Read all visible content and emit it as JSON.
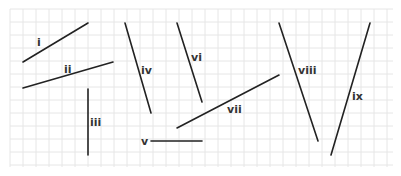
{
  "diagram": {
    "background": "#ffffff",
    "grid": {
      "x0": 10,
      "y0": 9,
      "x1": 393,
      "y1": 167,
      "cell": 13,
      "color": "#e6e6e6"
    },
    "line_color": "#222222",
    "segments": [
      {
        "label": "i",
        "x1": 23,
        "y1": 62,
        "x2": 88,
        "y2": 23,
        "lx": 37,
        "ly": 46
      },
      {
        "label": "ii",
        "x1": 23,
        "y1": 88,
        "x2": 113,
        "y2": 62,
        "lx": 64,
        "ly": 73
      },
      {
        "label": "iii",
        "x1": 88,
        "y1": 89,
        "x2": 88,
        "y2": 155,
        "lx": 90,
        "ly": 126
      },
      {
        "label": "iv",
        "x1": 125,
        "y1": 23,
        "x2": 151,
        "y2": 113,
        "lx": 141,
        "ly": 74
      },
      {
        "label": "v",
        "x1": 151,
        "y1": 141,
        "x2": 202,
        "y2": 141,
        "lx": 141,
        "ly": 145
      },
      {
        "label": "vi",
        "x1": 177,
        "y1": 23,
        "x2": 202,
        "y2": 102,
        "lx": 191,
        "ly": 61
      },
      {
        "label": "vii",
        "x1": 177,
        "y1": 128,
        "x2": 279,
        "y2": 75,
        "lx": 227,
        "ly": 113
      },
      {
        "label": "viii",
        "x1": 279,
        "y1": 23,
        "x2": 318,
        "y2": 141,
        "lx": 298,
        "ly": 74
      },
      {
        "label": "ix",
        "x1": 370,
        "y1": 23,
        "x2": 331,
        "y2": 155,
        "lx": 352,
        "ly": 100
      }
    ]
  }
}
